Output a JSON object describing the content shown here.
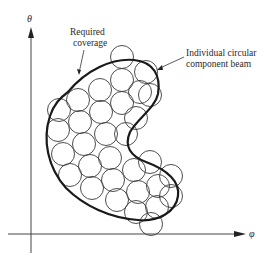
{
  "diagram": {
    "title": "",
    "axes": {
      "y_label": "θ",
      "x_label": "φ"
    },
    "annotations": {
      "required_coverage": [
        "Required",
        "coverage"
      ],
      "component_beam": [
        "Individual circular",
        "component beam"
      ]
    },
    "colors": {
      "stroke": "#333333",
      "outline": "#1a1a1a",
      "background": "#ffffff"
    },
    "beam_radius": 11.5,
    "beams": [
      [
        122,
        57
      ],
      [
        146,
        72
      ],
      [
        150,
        95
      ],
      [
        59,
        110
      ],
      [
        78,
        100
      ],
      [
        100,
        90
      ],
      [
        122,
        80
      ],
      [
        140,
        92
      ],
      [
        58,
        130
      ],
      [
        80,
        122
      ],
      [
        101,
        112
      ],
      [
        122,
        103
      ],
      [
        136,
        118
      ],
      [
        63,
        154
      ],
      [
        84,
        144
      ],
      [
        106,
        134
      ],
      [
        126,
        134
      ],
      [
        70,
        175
      ],
      [
        90,
        166
      ],
      [
        110,
        158
      ],
      [
        92,
        188
      ],
      [
        113,
        180
      ],
      [
        134,
        170
      ],
      [
        150,
        162
      ],
      [
        117,
        200
      ],
      [
        138,
        192
      ],
      [
        158,
        186
      ],
      [
        171,
        176
      ],
      [
        136,
        212
      ],
      [
        157,
        207
      ],
      [
        171,
        196
      ],
      [
        151,
        224
      ]
    ]
  }
}
